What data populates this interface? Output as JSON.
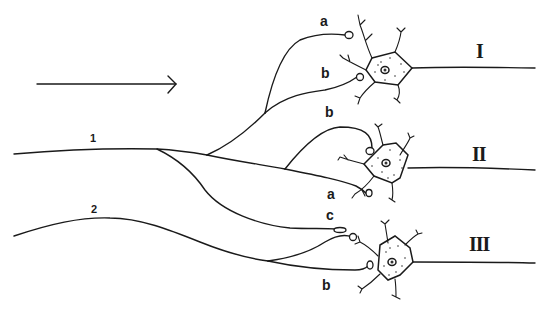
{
  "diagram": {
    "arrow": {
      "direction": "right"
    },
    "axons": [
      {
        "id": "1",
        "label": "1"
      },
      {
        "id": "2",
        "label": "2"
      }
    ],
    "neurons": [
      {
        "id": "I",
        "label": "I",
        "synapses": [
          {
            "label": "a"
          },
          {
            "label": "b"
          }
        ]
      },
      {
        "id": "II",
        "label": "II",
        "synapses": [
          {
            "label": "b"
          },
          {
            "label": "a"
          }
        ]
      },
      {
        "id": "III",
        "label": "III",
        "synapses": [
          {
            "label": "c"
          },
          {
            "label": "b"
          }
        ]
      }
    ],
    "colors": {
      "stroke": "#1a1a1a",
      "background": "#ffffff"
    }
  }
}
